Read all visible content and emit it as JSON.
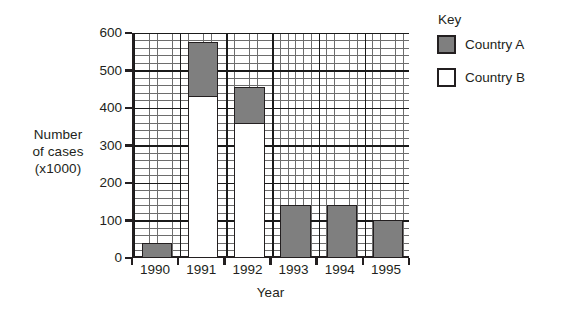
{
  "chart_data": {
    "type": "bar",
    "stacked": true,
    "title": "",
    "subtitle": "",
    "xlabel": "Year",
    "ylabel": "Number of cases (x1000)",
    "ylabel_lines": [
      "Number",
      "of cases",
      "(x1000)"
    ],
    "categories": [
      "1990",
      "1991",
      "1992",
      "1993",
      "1994",
      "1995"
    ],
    "series": [
      {
        "name": "Country B",
        "color": "#ffffff",
        "values": [
          0,
          430,
          360,
          0,
          0,
          0
        ]
      },
      {
        "name": "Country A",
        "color": "#7f7f7f",
        "values": [
          40,
          150,
          100,
          140,
          140,
          100
        ]
      }
    ],
    "totals": [
      40,
      580,
      460,
      140,
      140,
      100
    ],
    "ylim": [
      0,
      600
    ],
    "y_ticks": [
      0,
      100,
      200,
      300,
      400,
      500,
      600
    ],
    "y_tick_labels": [
      "0",
      "100",
      "200",
      "300",
      "400",
      "500",
      "600"
    ],
    "y_minor_step": 20,
    "grid": "major-and-minor",
    "legend_position": "right-top"
  },
  "legend": {
    "title": "Key",
    "entries": [
      {
        "label": "Country A",
        "color": "#7f7f7f"
      },
      {
        "label": "Country B",
        "color": "#ffffff"
      }
    ]
  },
  "colors": {
    "country_a": "#7f7f7f",
    "country_b": "#ffffff",
    "axis": "#231f20",
    "grid_major": "#1a1a1a",
    "grid_minor": "#6d6d6d",
    "background": "#ffffff"
  }
}
